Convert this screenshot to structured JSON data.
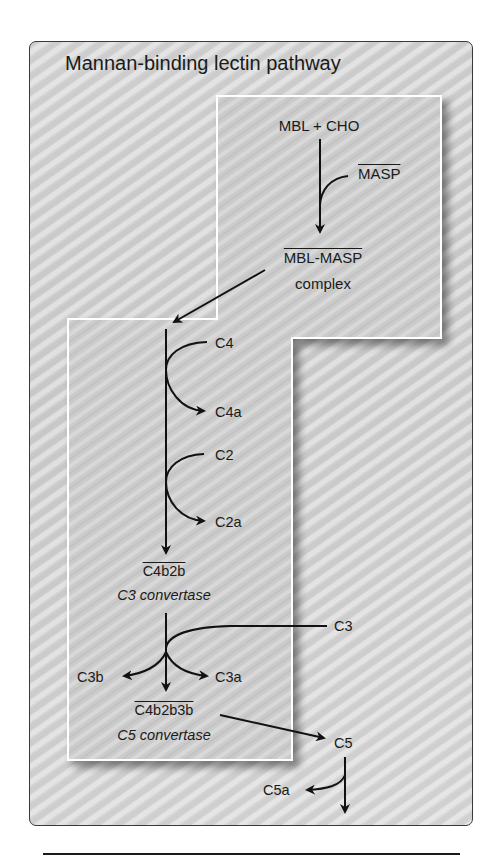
{
  "title": "Mannan-binding lectin pathway",
  "colors": {
    "outer_panel": "#d3d3d3",
    "inner_panel": "#cdcdcd",
    "inner_border": "#ffffff",
    "ink": "#1a1a1a"
  },
  "nodes": {
    "mbl_cho": "MBL + CHO",
    "masp": "MASP",
    "mbl_masp": "MBL-MASP",
    "complex": "complex",
    "c4": "C4",
    "c4a": "C4a",
    "c2": "C2",
    "c2a": "C2a",
    "c4b2b": "C4b2b",
    "c3_convertase": "C3 convertase",
    "c3": "C3",
    "c3b": "C3b",
    "c3a": "C3a",
    "c4b2b3b": "C4b2b3b",
    "c5_convertase": "C5 convertase",
    "c5": "C5",
    "c5a": "C5a"
  },
  "edges": [
    {
      "from": "MBL + CHO",
      "to": "MBL-MASP complex",
      "via": "MASP"
    },
    {
      "from": "MBL-MASP complex",
      "to": "cleavage chain"
    },
    {
      "from": "C4",
      "to": "C4a",
      "type": "cleavage"
    },
    {
      "from": "C2",
      "to": "C2a",
      "type": "cleavage"
    },
    {
      "to": "C4b2b (C3 convertase)"
    },
    {
      "from": "C3",
      "to": [
        "C3b",
        "C3a"
      ],
      "type": "cleavage"
    },
    {
      "to": "C4b2b3b (C5 convertase)"
    },
    {
      "from": "C4b2b3b",
      "to": "C5"
    },
    {
      "from": "C5",
      "to": "C5a",
      "type": "cleavage"
    }
  ]
}
